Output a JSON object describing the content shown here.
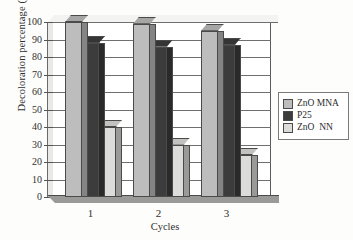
{
  "chart_data": {
    "type": "bar",
    "title": "",
    "subtitle": "",
    "xlabel": "Cycles",
    "ylabel": "Decoloration percentage (%)",
    "categories": [
      "1",
      "2",
      "3"
    ],
    "series": [
      {
        "name": "ZnO MNA",
        "values": [
          100,
          99,
          95
        ],
        "color": "#bdbdbd"
      },
      {
        "name": "P25",
        "values": [
          88,
          86,
          87
        ],
        "color": "#3c3c3c"
      },
      {
        "name": "ZnO  NN",
        "values": [
          40,
          30,
          24
        ],
        "color": "#dcdcda"
      }
    ],
    "ylim": [
      0,
      100
    ],
    "ytick_step": 10,
    "yticks": [
      "100",
      "90",
      "80",
      "70",
      "60",
      "50",
      "40",
      "30",
      "20",
      "10",
      "0"
    ],
    "grid": "horizontal",
    "legend_position": "right",
    "style": "3d-bars",
    "annotations": []
  },
  "legend": {
    "items": [
      {
        "label": "ZnO MNA",
        "color": "#bdbdbd"
      },
      {
        "label": "P25",
        "color": "#3c3c3c"
      },
      {
        "label": "ZnO  NN",
        "color": "#dcdcda"
      }
    ]
  }
}
